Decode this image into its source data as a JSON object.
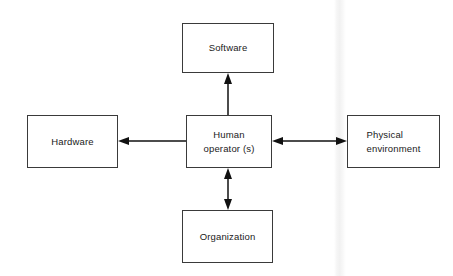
{
  "diagram": {
    "background_color": "#ffffff",
    "line_color": "#111111",
    "box_border_color": "#3a3a3a",
    "text_color": "#1a1a1a",
    "nodes": [
      {
        "id": "software",
        "label": "Software",
        "x": 182,
        "y": 23,
        "w": 92,
        "h": 50
      },
      {
        "id": "hardware",
        "label": "Hardware",
        "x": 27,
        "y": 115,
        "w": 91,
        "h": 53
      },
      {
        "id": "human-operator",
        "label": "Human\noperator (s)",
        "x": 186,
        "y": 115,
        "w": 86,
        "h": 53
      },
      {
        "id": "physical-environment",
        "label": "Physical\nenvironment",
        "x": 347,
        "y": 115,
        "w": 93,
        "h": 53
      },
      {
        "id": "organization",
        "label": "Organization",
        "x": 182,
        "y": 210,
        "w": 91,
        "h": 53
      }
    ],
    "edges": [
      {
        "id": "human-to-software",
        "from": "human-operator",
        "to": "software",
        "direction": "single",
        "orientation": "vertical",
        "x1": 228,
        "y1": 115,
        "x2": 228,
        "y2": 73
      },
      {
        "id": "human-to-hardware",
        "from": "human-operator",
        "to": "hardware",
        "direction": "single",
        "orientation": "horizontal",
        "x1": 186,
        "y1": 141,
        "x2": 118,
        "y2": 141
      },
      {
        "id": "human-to-physical-environment",
        "from": "human-operator",
        "to": "physical-environment",
        "direction": "double",
        "orientation": "horizontal",
        "x1": 272,
        "y1": 141,
        "x2": 347,
        "y2": 141
      },
      {
        "id": "human-to-organization",
        "from": "human-operator",
        "to": "organization",
        "direction": "double",
        "orientation": "vertical",
        "x1": 228,
        "y1": 168,
        "x2": 228,
        "y2": 210
      }
    ],
    "artifacts": [
      {
        "id": "scan-band",
        "x": 334,
        "w": 12
      }
    ]
  }
}
